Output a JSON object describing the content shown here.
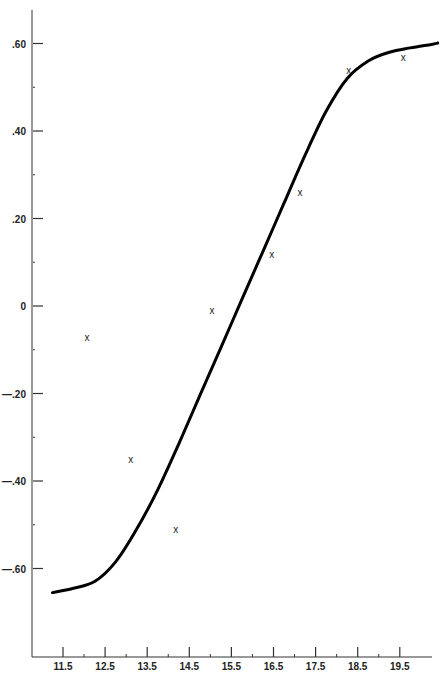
{
  "chart_data": {
    "type": "scatter",
    "title": "",
    "xlabel": "",
    "ylabel": "",
    "xlim": [
      11.0,
      20.5
    ],
    "ylim": [
      -0.8,
      0.7
    ],
    "grid": false,
    "legend": null,
    "x_ticks": [
      11.5,
      12.5,
      13.5,
      14.5,
      15.5,
      16.5,
      17.5,
      18.5,
      19.5
    ],
    "x_tick_labels": [
      "11.5",
      "12.5",
      "13.5",
      "14.5",
      "15.5",
      "16.5",
      "17.5",
      "18.5",
      "19.5"
    ],
    "y_ticks": [
      0.6,
      0.4,
      0.2,
      0,
      -0.2,
      -0.4,
      -0.6
    ],
    "y_tick_labels": [
      ".60",
      ".40",
      ".20",
      "0",
      "—.20",
      "—.40",
      "—.60"
    ],
    "series": [
      {
        "name": "observations",
        "marker": "x",
        "x": [
          12.07,
          13.11,
          14.18,
          15.04,
          16.46,
          17.13,
          18.29,
          19.58
        ],
        "y": [
          -0.07,
          -0.35,
          -0.51,
          -0.01,
          0.12,
          0.26,
          0.54,
          0.57
        ]
      },
      {
        "name": "fitted curve",
        "type": "line",
        "x": [
          11.25,
          11.75,
          12.25,
          12.75,
          13.25,
          13.75,
          14.25,
          14.75,
          15.25,
          15.75,
          16.25,
          16.75,
          17.25,
          17.75,
          18.25,
          18.75,
          19.25,
          19.75,
          20.25,
          20.4
        ],
        "y": [
          -0.655,
          -0.645,
          -0.63,
          -0.585,
          -0.51,
          -0.42,
          -0.315,
          -0.205,
          -0.095,
          0.015,
          0.125,
          0.235,
          0.345,
          0.445,
          0.52,
          0.56,
          0.58,
          0.59,
          0.598,
          0.601
        ]
      }
    ]
  }
}
